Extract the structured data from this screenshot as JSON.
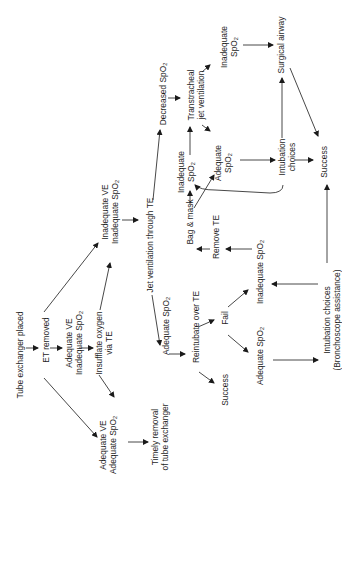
{
  "diagram": {
    "orientation": "rotated-90-ccw",
    "nodes": [
      {
        "id": "tube_exchanger_placed",
        "lines": [
          "Tube exchanger placed"
        ],
        "x": 20,
        "y": 355
      },
      {
        "id": "et_removed",
        "lines": [
          "ET removed"
        ],
        "x": 46,
        "y": 340
      },
      {
        "id": "adequate_ve_inadequate_spo2",
        "lines": [
          "Adequate VE",
          "Inadequate SpO2"
        ],
        "x": 74,
        "y": 343
      },
      {
        "id": "insufflate_oxygen",
        "lines": [
          "Insufflate oxygen",
          "via TE"
        ],
        "x": 104,
        "y": 343
      },
      {
        "id": "adequate_ve_adequate_spo2",
        "lines": [
          "Adequate VE",
          "Adequate SpO2"
        ],
        "x": 108,
        "y": 445
      },
      {
        "id": "timely_removal",
        "lines": [
          "Timely removal",
          "of tube exchanger"
        ],
        "x": 160,
        "y": 437
      },
      {
        "id": "inadequate_ve_inadequate_spo2",
        "lines": [
          "Inadequate VE",
          "Inadequate SpO2"
        ],
        "x": 110,
        "y": 212
      },
      {
        "id": "jet_ventilation_te",
        "lines": [
          "Jet ventilation through TE"
        ],
        "x": 150,
        "y": 245
      },
      {
        "id": "adequate_spo2_after_jet",
        "lines": [
          "Adequate SpO2"
        ],
        "x": 166,
        "y": 326
      },
      {
        "id": "reintubate_over_te",
        "lines": [
          "Reintubate over TE"
        ],
        "x": 196,
        "y": 327
      },
      {
        "id": "success_reintubate",
        "lines": [
          "Success"
        ],
        "x": 225,
        "y": 390
      },
      {
        "id": "fail",
        "lines": [
          "Fail"
        ],
        "x": 225,
        "y": 318
      },
      {
        "id": "adequate_spo2_after_fail",
        "lines": [
          "Adequate SpO2"
        ],
        "x": 260,
        "y": 356
      },
      {
        "id": "inadequate_spo2_after_fail",
        "lines": [
          "Inadequate SpO2"
        ],
        "x": 260,
        "y": 272
      },
      {
        "id": "intubation_choices_bronch",
        "lines": [
          "Intubation choices",
          "(Bronchoscope assistance)"
        ],
        "x": 332,
        "y": 320
      },
      {
        "id": "remove_te",
        "lines": [
          "Remove TE"
        ],
        "x": 216,
        "y": 237
      },
      {
        "id": "bag_mask",
        "lines": [
          "Bag & mask"
        ],
        "x": 190,
        "y": 222
      },
      {
        "id": "decreased_spo2",
        "lines": [
          "Decreased SpO2"
        ],
        "x": 163,
        "y": 94
      },
      {
        "id": "transtracheal_jet",
        "lines": [
          "Transtracheal",
          "jet ventilation"
        ],
        "x": 196,
        "y": 95
      },
      {
        "id": "inadequate_spo2_top",
        "lines": [
          "Inadequate",
          "SpO2"
        ],
        "x": 229,
        "y": 47
      },
      {
        "id": "surgical_airway",
        "lines": [
          "Surgical airway"
        ],
        "x": 281,
        "y": 45
      },
      {
        "id": "inadequate_spo2_mid",
        "lines": [
          "Inadequate",
          "SpO2"
        ],
        "x": 186,
        "y": 172
      },
      {
        "id": "adequate_spo2_mid",
        "lines": [
          "Adequate",
          "SpO2"
        ],
        "x": 223,
        "y": 163
      },
      {
        "id": "intubation_choices_mid",
        "lines": [
          "Intubation",
          "choices"
        ],
        "x": 287,
        "y": 157
      },
      {
        "id": "success_final",
        "lines": [
          "Success"
        ],
        "x": 324,
        "y": 162
      }
    ],
    "edges": [
      {
        "from": "tube_exchanger_placed",
        "to": "et_removed",
        "points": [
          [
            26,
            348
          ],
          [
            38,
            348
          ]
        ]
      },
      {
        "from": "et_removed",
        "to": "adequate_ve_inadequate_spo2",
        "points": [
          [
            50,
            348
          ],
          [
            62,
            348
          ]
        ]
      },
      {
        "from": "adequate_ve_inadequate_spo2",
        "to": "insufflate_oxygen",
        "points": [
          [
            79,
            348
          ],
          [
            93,
            348
          ]
        ]
      },
      {
        "from": "et_removed",
        "to": "adequate_ve_adequate_spo2",
        "points": [
          [
            44,
            378
          ],
          [
            97,
            437
          ]
        ]
      },
      {
        "from": "et_removed",
        "to": "inadequate_ve_inadequate_spo2",
        "points": [
          [
            44,
            312
          ],
          [
            98,
            243
          ]
        ]
      },
      {
        "from": "insufflate_oxygen",
        "to": "inadequate_ve_inadequate_spo2",
        "points": [
          [
            100,
            310
          ],
          [
            110,
            263
          ]
        ]
      },
      {
        "from": "insufflate_oxygen",
        "to": "adequate_ve_adequate_spo2",
        "points": [
          [
            99,
            375
          ],
          [
            114,
            397
          ]
        ]
      },
      {
        "from": "adequate_ve_adequate_spo2",
        "to": "timely_removal",
        "points": [
          [
            128,
            442
          ],
          [
            148,
            442
          ]
        ]
      },
      {
        "from": "inadequate_ve_inadequate_spo2",
        "to": "jet_ventilation_te",
        "points": [
          [
            122,
            220
          ],
          [
            138,
            220
          ]
        ]
      },
      {
        "from": "jet_ventilation_te",
        "to": "decreased_spo2",
        "points": [
          [
            153,
            200
          ],
          [
            160,
            130
          ]
        ]
      },
      {
        "from": "jet_ventilation_te",
        "to": "adequate_spo2_after_jet",
        "points": [
          [
            152,
            295
          ],
          [
            160,
            345
          ]
        ]
      },
      {
        "from": "adequate_spo2_after_jet",
        "to": "reintubate_over_te",
        "points": [
          [
            169,
            354
          ],
          [
            185,
            354
          ]
        ]
      },
      {
        "from": "reintubate_over_te",
        "to": "success_reintubate",
        "points": [
          [
            199,
            372
          ],
          [
            214,
            383
          ]
        ]
      },
      {
        "from": "reintubate_over_te",
        "to": "fail",
        "points": [
          [
            198,
            327
          ],
          [
            214,
            320
          ]
        ]
      },
      {
        "from": "fail",
        "to": "adequate_spo2_after_fail",
        "points": [
          [
            228,
            335
          ],
          [
            248,
            352
          ]
        ]
      },
      {
        "from": "fail",
        "to": "inadequate_spo2_after_fail",
        "points": [
          [
            228,
            307
          ],
          [
            248,
            290
          ]
        ]
      },
      {
        "from": "adequate_spo2_after_fail",
        "to": "intubation_choices_bronch",
        "points": [
          [
            273,
            360
          ],
          [
            318,
            360
          ]
        ]
      },
      {
        "from": "intubation_choices_bronch",
        "to": "inadequate_spo2_after_fail",
        "points": [
          [
            318,
            284
          ],
          [
            272,
            284
          ]
        ]
      },
      {
        "from": "intubation_choices_bronch",
        "to": "success_final",
        "points": [
          [
            327,
            263
          ],
          [
            327,
            185
          ]
        ]
      },
      {
        "from": "inadequate_spo2_after_fail",
        "to": "remove_te",
        "points": [
          [
            252,
            249
          ],
          [
            226,
            249
          ]
        ]
      },
      {
        "from": "remove_te",
        "to": "bag_mask",
        "points": [
          [
            210,
            249
          ],
          [
            197,
            249
          ]
        ]
      },
      {
        "from": "bag_mask",
        "to": "inadequate_spo2_mid",
        "points": [
          [
            190,
            205
          ],
          [
            190,
            191
          ]
        ]
      },
      {
        "from": "bag_mask",
        "to": "adequate_spo2_mid",
        "points": [
          [
            194,
            208
          ],
          [
            214,
            175
          ]
        ]
      },
      {
        "from": "inadequate_spo2_mid",
        "to": "transtracheal_jet",
        "points": [
          [
            190,
            155
          ],
          [
            190,
            127
          ]
        ]
      },
      {
        "from": "decreased_spo2",
        "to": "transtracheal_jet",
        "points": [
          [
            168,
            98
          ],
          [
            180,
            98
          ]
        ]
      },
      {
        "from": "transtracheal_jet",
        "to": "inadequate_spo2_top",
        "points": [
          [
            202,
            72
          ],
          [
            210,
            65
          ]
        ]
      },
      {
        "from": "transtracheal_jet",
        "to": "adequate_spo2_mid",
        "points": [
          [
            202,
            125
          ],
          [
            210,
            131
          ]
        ]
      },
      {
        "from": "inadequate_spo2_top",
        "to": "surgical_airway",
        "points": [
          [
            243,
            45
          ],
          [
            273,
            45
          ]
        ]
      },
      {
        "from": "adequate_spo2_mid",
        "to": "intubation_choices_mid",
        "points": [
          [
            240,
            160
          ],
          [
            275,
            160
          ]
        ]
      },
      {
        "from": "intubation_choices_mid",
        "to": "surgical_airway",
        "points": [
          [
            282,
            138
          ],
          [
            282,
            78
          ]
        ]
      },
      {
        "from": "intubation_choices_mid",
        "to": "success_final",
        "points": [
          [
            295,
            160
          ],
          [
            313,
            160
          ]
        ]
      },
      {
        "from": "surgical_airway",
        "to": "success_final",
        "points": [
          [
            290,
            68
          ],
          [
            318,
            136
          ]
        ]
      },
      {
        "from": "intubation_choices_mid",
        "to": "inadequate_spo2_mid",
        "curve": "M283 185 Q283 193 270 193 L215 190 Q200 190 195 185",
        "points": [
          [
            195,
            185
          ],
          [
            194,
            183
          ]
        ]
      }
    ]
  }
}
